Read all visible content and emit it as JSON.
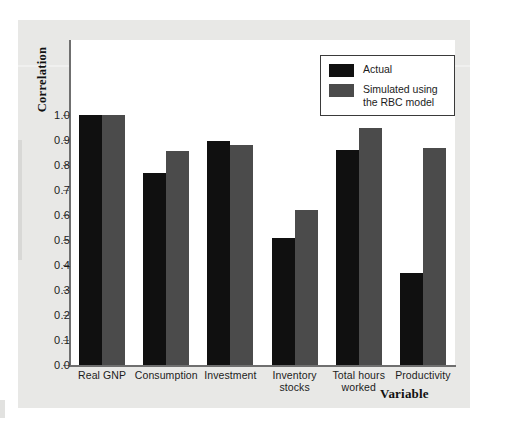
{
  "chart_data": {
    "type": "bar",
    "title": "",
    "xlabel": "Variable",
    "ylabel": "Correlation",
    "ylim": [
      0.0,
      1.0
    ],
    "grid": false,
    "legend_position": "top-right",
    "categories": [
      "Real GNP",
      "Consumption",
      "Investment",
      "Inventory\nstocks",
      "Total hours\nworked",
      "Productivity"
    ],
    "ytick_labels": [
      "0.0",
      "0.1",
      "0.2",
      "0.3",
      "0.4",
      "0.5",
      "0.6",
      "0.7",
      "0.8",
      "0.9",
      "1.0"
    ],
    "ytick_values": [
      0.0,
      0.1,
      0.2,
      0.3,
      0.4,
      0.5,
      0.6,
      0.7,
      0.8,
      0.9,
      1.0
    ],
    "series": [
      {
        "name": "Actual",
        "color": "#101010",
        "values": [
          1.0,
          0.77,
          0.895,
          0.51,
          0.86,
          0.37
        ]
      },
      {
        "name": "Simulated using\nthe RBC model",
        "color": "#4b4b4b",
        "values": [
          1.0,
          0.855,
          0.88,
          0.62,
          0.95,
          0.87
        ]
      }
    ]
  },
  "legend": {
    "entries": [
      {
        "label": "Actual",
        "color": "#101010"
      },
      {
        "label": "Simulated using\nthe RBC model",
        "color": "#4b4b4b"
      }
    ]
  },
  "axes": {
    "y_title": "Correlation",
    "x_title": "Variable"
  },
  "colors": {
    "page_background": "#e8e8e6",
    "plot_background": "#ffffff",
    "axis_line": "#6f6f6f",
    "text": "#1c1c1c",
    "series_actual": "#101010",
    "series_simulated": "#4b4b4b"
  }
}
